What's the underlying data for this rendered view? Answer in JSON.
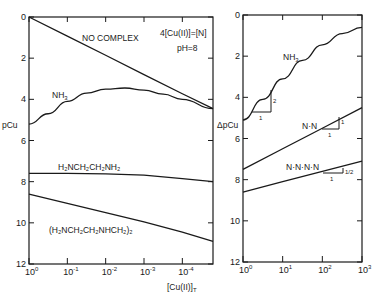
{
  "chart_data": [
    {
      "type": "line",
      "title": "",
      "xlabel": "[Cu(II)]_T",
      "ylabel": "pCu",
      "xscale": "log",
      "x_ticks": [
        "10^0",
        "10^-1",
        "10^-2",
        "10^-3",
        "10^-4"
      ],
      "x_tick_exponents": [
        0,
        -1,
        -2,
        -3,
        -4
      ],
      "xlim_exp": [
        0,
        -4.8
      ],
      "y_ticks": [
        0,
        2,
        4,
        6,
        8,
        10,
        12
      ],
      "ylim": [
        0,
        12
      ],
      "y_inverted": true,
      "annotations": [
        "4[Cu(II)]=[N]",
        "pH=8"
      ],
      "series": [
        {
          "name": "NO COMPLEX",
          "x_exp": [
            0,
            -1,
            -2,
            -3,
            -4,
            -4.8
          ],
          "values": [
            0,
            0.93,
            1.86,
            2.8,
            3.73,
            4.45
          ]
        },
        {
          "name": "NH3",
          "x_exp": [
            0,
            -0.5,
            -1,
            -1.5,
            -2,
            -2.5,
            -3,
            -3.5,
            -4,
            -4.8
          ],
          "values": [
            5.2,
            4.7,
            4.1,
            3.7,
            3.5,
            3.45,
            3.55,
            3.75,
            4.0,
            4.45
          ]
        },
        {
          "name": "H2NCH2CH2NH2",
          "x_exp": [
            0,
            -1,
            -2,
            -3,
            -4,
            -4.8
          ],
          "values": [
            7.6,
            7.6,
            7.62,
            7.68,
            7.85,
            8.0
          ]
        },
        {
          "name": "(H2NCH2CH2NHCH2)2",
          "x_exp": [
            0,
            -1,
            -2,
            -3,
            -4,
            -4.8
          ],
          "values": [
            8.6,
            9.05,
            9.5,
            9.95,
            10.45,
            10.9
          ]
        }
      ]
    },
    {
      "type": "line",
      "title": "",
      "xlabel": "",
      "ylabel": "ΔpCu",
      "xscale": "log",
      "x_ticks": [
        "10^0",
        "10^1",
        "10^2",
        "10^3"
      ],
      "x_tick_exponents": [
        0,
        1,
        2,
        3
      ],
      "xlim_exp": [
        0,
        3
      ],
      "y_ticks": [
        0,
        2,
        4,
        6,
        8,
        10,
        12
      ],
      "ylim": [
        0,
        12
      ],
      "y_inverted": true,
      "series": [
        {
          "name": "NH3",
          "x_exp": [
            0,
            0.5,
            1,
            1.5,
            2,
            2.5,
            3
          ],
          "values": [
            5.1,
            4.1,
            3.1,
            2.2,
            1.45,
            0.9,
            0.6
          ],
          "slope_annotation": {
            "run": "1",
            "rise": "2"
          }
        },
        {
          "name": "N·N",
          "x_exp": [
            0,
            1,
            2,
            3
          ],
          "values": [
            7.5,
            6.5,
            5.5,
            4.5
          ],
          "slope_annotation": {
            "run": "1",
            "rise": "1"
          }
        },
        {
          "name": "N·N·N·N",
          "x_exp": [
            0,
            1,
            2,
            3
          ],
          "values": [
            8.6,
            8.1,
            7.6,
            7.1
          ],
          "slope_annotation": {
            "run": "1",
            "rise": "1/2"
          }
        }
      ]
    }
  ],
  "labels": {
    "left_ylabel": "pCu",
    "right_ylabel": "ΔpCu",
    "xlabel_main": "[Cu(II)]",
    "xlabel_sub": "T",
    "annot_eq": "4[Cu(II)]=[N]",
    "annot_ph": "pH=8",
    "no_complex": "NO COMPLEX",
    "nh3": "NH",
    "nh3_sub": "3",
    "en": "H₂NCH₂CH₂NH₂",
    "trien": "(H₂NCH₂CH₂NHCH₂)₂",
    "nn": "N·N",
    "nnnn": "N·N·N·N",
    "slope_one": "1",
    "slope_two": "2",
    "slope_half": "1/2"
  }
}
